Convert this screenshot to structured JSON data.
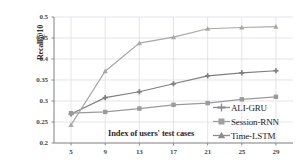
{
  "chart_data": {
    "type": "line",
    "title": "",
    "xlabel": "Index of users' test cases",
    "ylabel": "Recall@10",
    "x": [
      5,
      9,
      13,
      17,
      21,
      25,
      29
    ],
    "xtick_labels": [
      "5",
      "9",
      "13",
      "17",
      "21",
      "25",
      "29"
    ],
    "ytick_labels": [
      "0.5",
      "0.45",
      "0.4",
      "0.35",
      "0.3",
      "0.25",
      "0.2"
    ],
    "ytick_values": [
      0.5,
      0.45,
      0.4,
      0.35,
      0.3,
      0.25,
      0.2
    ],
    "xlim": [
      3,
      31
    ],
    "ylim": [
      0.2,
      0.5
    ],
    "grid": true,
    "legend_position": "bottom-right",
    "series": [
      {
        "name": "ALI-GRU",
        "color": "#7f7f7f",
        "marker": "plus",
        "values": [
          0.269,
          0.308,
          0.322,
          0.341,
          0.36,
          0.367,
          0.372
        ]
      },
      {
        "name": "Session-RNN",
        "color": "#9a9a9a",
        "marker": "square",
        "values": [
          0.271,
          0.274,
          0.282,
          0.291,
          0.295,
          0.304,
          0.31
        ]
      },
      {
        "name": "Time-LSTM",
        "color": "#a8a8a8",
        "marker": "triangle",
        "values": [
          0.243,
          0.371,
          0.438,
          0.452,
          0.472,
          0.475,
          0.477
        ]
      }
    ]
  },
  "axes": {
    "ylabel": "Recall@10",
    "xlabel": "Index of users' test cases"
  },
  "legend": {
    "items": [
      {
        "label": "ALI-GRU"
      },
      {
        "label": "Session-RNN"
      },
      {
        "label": "Time-LSTM"
      }
    ]
  },
  "colors": {
    "grid": "#d8d8e4",
    "axis": "#8a8a8a",
    "text": "#2b2b2b",
    "series_ali_gru": "#7f7f7f",
    "series_session_rnn": "#9a9a9a",
    "series_time_lstm": "#a8a8a8"
  }
}
